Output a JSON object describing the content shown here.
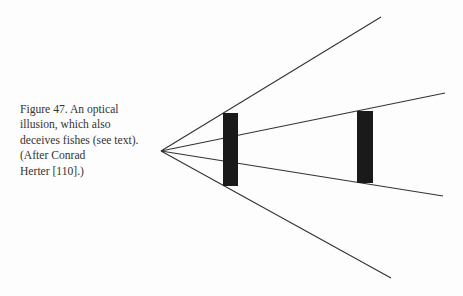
{
  "caption": {
    "lines": [
      "Figure 47. An optical",
      "illusion, which also",
      "deceives fishes (see text).",
      "(After Conrad",
      "Herter [110].)"
    ]
  },
  "figure": {
    "type": "optical-illusion-diagram",
    "vertex": [
      161,
      151
    ],
    "rays": [
      {
        "name": "upper-outer",
        "end": [
          381,
          17
        ]
      },
      {
        "name": "upper-inner",
        "end": [
          445,
          93
        ]
      },
      {
        "name": "lower-inner",
        "end": [
          443,
          196
        ]
      },
      {
        "name": "lower-outer",
        "end": [
          391,
          278
        ]
      }
    ],
    "bars": [
      {
        "name": "near-bar",
        "x": 223,
        "y": 113,
        "w": 15,
        "h": 73
      },
      {
        "name": "far-bar",
        "x": 357,
        "y": 111,
        "w": 16,
        "h": 72
      }
    ],
    "colors": {
      "line": "#333333",
      "bar": "#1a1a1a"
    }
  }
}
